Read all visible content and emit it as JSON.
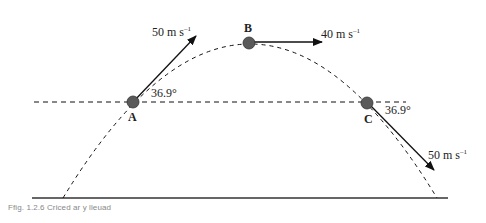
{
  "diagram": {
    "type": "projectile-motion",
    "points": {
      "A": {
        "label": "A",
        "velocity_label": "50 m s",
        "angle_label": "36.9°"
      },
      "B": {
        "label": "B",
        "velocity_label": "40 m s"
      },
      "C": {
        "label": "C",
        "velocity_label": "50 m s",
        "angle_label": "36.9°"
      }
    },
    "unit_exponent": "–1",
    "colors": {
      "ball": "#555555",
      "line": "#111111"
    }
  },
  "caption": "Ffig. 1.2.6 Criced ar y lleuad"
}
